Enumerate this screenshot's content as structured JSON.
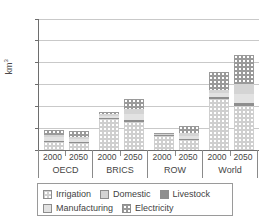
{
  "chart_data": {
    "type": "bar",
    "title": "",
    "xlabel": "",
    "ylabel": "km³",
    "ylim": [
      0,
      6000
    ],
    "yticks": [
      0,
      1000,
      2000,
      3000,
      4000,
      5000,
      6000
    ],
    "ytick_labels": [
      "0",
      "1000",
      "2000",
      "3000",
      "4000",
      "5000",
      "6000"
    ],
    "grid": true,
    "stacked": true,
    "legend_position": "bottom",
    "groups": [
      "OECD",
      "BRICS",
      "ROW",
      "World"
    ],
    "sub_categories": [
      "2000",
      "2050"
    ],
    "categories": [
      "OECD 2000",
      "OECD 2050",
      "BRICS 2000",
      "BRICS 2050",
      "ROW 2000",
      "ROW 2050",
      "World 2000",
      "World 2050"
    ],
    "series": [
      {
        "name": "Irrigation",
        "color": "#cfcfcf",
        "values": [
          380,
          340,
          1400,
          1290,
          640,
          480,
          2330,
          2020
        ]
      },
      {
        "name": "Livestock",
        "color": "#8e8e8e",
        "values": [
          30,
          40,
          60,
          80,
          30,
          40,
          110,
          140
        ]
      },
      {
        "name": "Manufacturing",
        "color": "#e2e2e2",
        "values": [
          170,
          130,
          110,
          260,
          40,
          140,
          180,
          420
        ]
      },
      {
        "name": "Domestic",
        "color": "#d4d4d4",
        "values": [
          120,
          100,
          80,
          240,
          40,
          120,
          150,
          430
        ]
      },
      {
        "name": "Electricity",
        "color": "#9a9a9a",
        "values": [
          230,
          250,
          100,
          470,
          20,
          320,
          790,
          1360
        ]
      }
    ],
    "totals": [
      930,
      860,
      1750,
      3270,
      770,
      1300,
      3560,
      5440
    ]
  },
  "legend": {
    "items": [
      {
        "label": "Irrigation",
        "fill": "irrigation"
      },
      {
        "label": "Domestic",
        "fill": "domestic"
      },
      {
        "label": "Livestock",
        "fill": "livestock"
      },
      {
        "label": "Manufacturing",
        "fill": "manufacturing"
      },
      {
        "label": "Electricity",
        "fill": "electricity"
      }
    ]
  }
}
